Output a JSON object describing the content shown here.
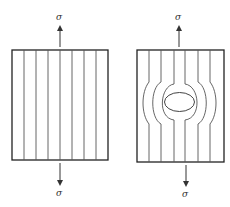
{
  "diagram": {
    "left_panel": {
      "description": "uniform stress trajectories",
      "top_label": "σ",
      "bottom_label": "σ",
      "line_count": 7
    },
    "right_panel": {
      "description": "stress trajectories around elliptical hole",
      "top_label": "σ",
      "bottom_label": "σ",
      "line_count": 6,
      "feature": "elliptical-hole"
    },
    "colors": {
      "outline": "#222222",
      "lines": "#555555",
      "background": "#ffffff"
    }
  }
}
